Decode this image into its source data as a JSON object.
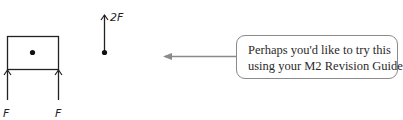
{
  "diagram": {
    "body_shape": "rectangle",
    "forces": [
      {
        "label": "F",
        "direction": "up",
        "position": "left support"
      },
      {
        "label": "F",
        "direction": "up",
        "position": "right support"
      },
      {
        "label": "2F",
        "direction": "up",
        "position": "point"
      }
    ],
    "labels": {
      "left_force": "F",
      "right_force": "F",
      "point_force": "2F"
    },
    "colors": {
      "line": "#222222",
      "connector": "#8a8a8a",
      "callout_border": "#8a8a8a"
    }
  },
  "callout": {
    "line1": "Perhaps you'd like to try this",
    "line2": "using your M2 Revision Guide?"
  }
}
